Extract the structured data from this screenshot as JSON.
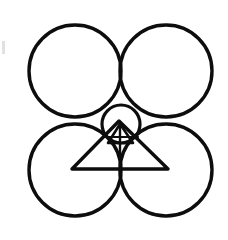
{
  "figure": {
    "title": "Four tangent circles with inscribed central circle and triangles",
    "background_color": "#ffffff",
    "ink_color": "#0d0d0d",
    "canvas": {
      "width": 228,
      "height": 240
    }
  },
  "geometry": {
    "big_circles": {
      "label": "four tangent circles",
      "radius": 46,
      "stroke_width": 3.4,
      "count": 4,
      "items": [
        {
          "name": "top-left-circle",
          "cx": 75,
          "cy": 71
        },
        {
          "name": "top-right-circle",
          "cx": 166,
          "cy": 71
        },
        {
          "name": "bottom-left-circle",
          "cx": 75,
          "cy": 170
        },
        {
          "name": "bottom-right-circle",
          "cx": 166,
          "cy": 170
        }
      ]
    },
    "center_circle": {
      "name": "center-circle",
      "label": "small inscribed circle",
      "cx": 121,
      "cy": 124,
      "r": 19,
      "stroke_width": 3.2
    },
    "large_triangle": {
      "name": "large-triangle",
      "label": "large overlaid triangle",
      "stroke_width": 3.4,
      "points": "119,121 72,169 168,169"
    },
    "small_triangle": {
      "name": "small-triangle",
      "label": "small triangle inside center circle",
      "stroke_width": 2.6,
      "points": "120,124 108,143 133,143"
    },
    "median_line": {
      "name": "median-line",
      "label": "vertical median line",
      "stroke_width": 2.4,
      "x1": 120,
      "y1": 122,
      "x2": 120,
      "y2": 176
    },
    "inner_chord": {
      "name": "inner-chord",
      "label": "horizontal chord in center circle",
      "stroke_width": 2.2,
      "x1": 104,
      "y1": 137,
      "x2": 138,
      "y2": 137
    },
    "smudge": {
      "name": "left-edge-smudge",
      "label": "faint scanner smudge at left margin",
      "x": 2,
      "y": 41,
      "width": 3,
      "height": 13
    }
  }
}
